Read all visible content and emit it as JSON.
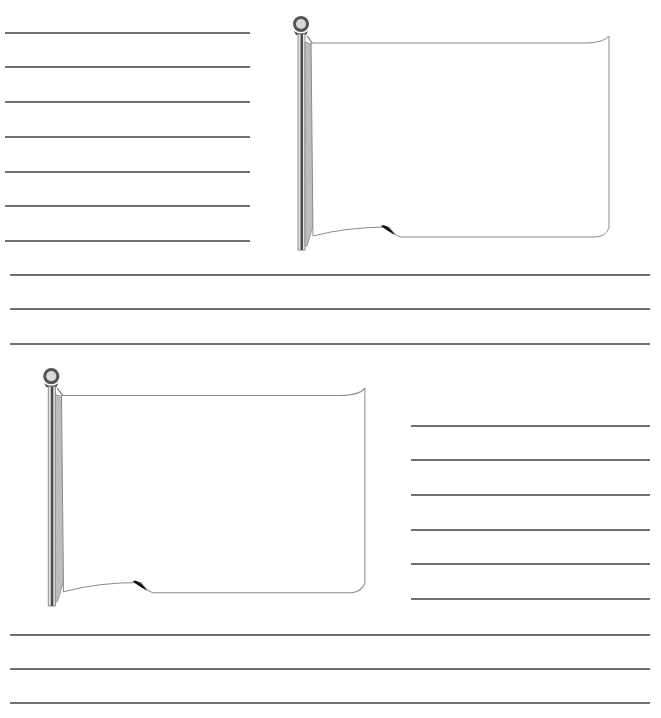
{
  "page": {
    "colors": {
      "line": "#6f6f6f",
      "pole_dark": "#4a4a4a",
      "pole_light": "#bdbdbd",
      "flag_outline": "#8a8a8a"
    }
  },
  "sections": [
    {
      "name": "top",
      "flag": {
        "x": 285,
        "y": 14,
        "w": 330,
        "h": 240
      },
      "short_lines": {
        "x": 5,
        "width": 245,
        "ys": [
          32,
          66,
          101,
          136,
          171,
          205,
          240
        ]
      },
      "full_lines": {
        "x": 10,
        "width": 640,
        "ys": [
          274,
          308,
          343
        ]
      }
    },
    {
      "name": "bottom",
      "flag": {
        "x": 35,
        "y": 366,
        "w": 336,
        "h": 244
      },
      "short_lines": {
        "x": 411,
        "width": 239,
        "ys": [
          425,
          459,
          494,
          529,
          563,
          598
        ]
      },
      "full_lines": {
        "x": 10,
        "width": 640,
        "ys": [
          634,
          668,
          702
        ]
      }
    }
  ]
}
